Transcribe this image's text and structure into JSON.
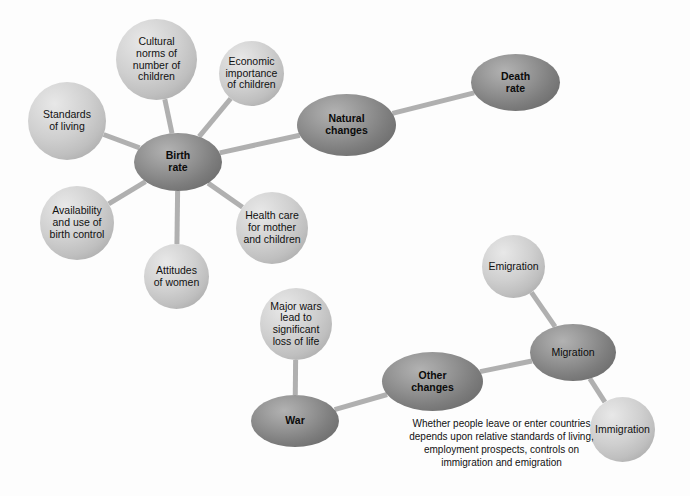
{
  "diagram": {
    "colors": {
      "background": "#fdfdfd",
      "light_node": "#cfcfcf",
      "dark_node": "#8f8f8f",
      "edge": "#b0b0b0",
      "text": "#111111"
    },
    "nodes": [
      {
        "id": "cultural-norms",
        "label": "Cultural\nnorms of\nnumber of\nchildren",
        "style": "light",
        "shape": "circle",
        "x": 116,
        "y": 19,
        "w": 81,
        "h": 81
      },
      {
        "id": "economic-importance",
        "label": "Economic\nimportance\nof children",
        "style": "light",
        "shape": "circle",
        "x": 219,
        "y": 41,
        "w": 65,
        "h": 65
      },
      {
        "id": "standards-of-living",
        "label": "Standards\nof living",
        "style": "light",
        "shape": "circle",
        "x": 28,
        "y": 82,
        "w": 78,
        "h": 78
      },
      {
        "id": "birth-rate",
        "label": "Birth\nrate",
        "style": "dark",
        "shape": "ellipse",
        "x": 134,
        "y": 133,
        "w": 88,
        "h": 58
      },
      {
        "id": "natural-changes",
        "label": "Natural\nchanges",
        "style": "dark",
        "shape": "ellipse",
        "x": 297,
        "y": 94,
        "w": 99,
        "h": 62
      },
      {
        "id": "death-rate",
        "label": "Death\nrate",
        "style": "dark",
        "shape": "ellipse",
        "x": 471,
        "y": 54,
        "w": 89,
        "h": 57
      },
      {
        "id": "availability-birth-control",
        "label": "Availability\nand use of\nbirth control",
        "style": "light",
        "shape": "circle",
        "x": 40,
        "y": 186,
        "w": 74,
        "h": 74
      },
      {
        "id": "attitudes-of-women",
        "label": "Attitudes\nof women",
        "style": "light",
        "shape": "circle",
        "x": 144,
        "y": 244,
        "w": 65,
        "h": 65
      },
      {
        "id": "health-care",
        "label": "Health care\nfor mother\nand children",
        "style": "light",
        "shape": "circle",
        "x": 236,
        "y": 192,
        "w": 72,
        "h": 72
      },
      {
        "id": "major-wars",
        "label": "Major wars\nlead to\nsignificant\nloss of life",
        "style": "light",
        "shape": "circle",
        "x": 260,
        "y": 288,
        "w": 72,
        "h": 72
      },
      {
        "id": "war",
        "label": "War",
        "style": "dark",
        "shape": "ellipse",
        "x": 251,
        "y": 395,
        "w": 88,
        "h": 52
      },
      {
        "id": "other-changes",
        "label": "Other\nchanges",
        "style": "dark",
        "shape": "ellipse",
        "x": 382,
        "y": 352,
        "w": 101,
        "h": 59
      },
      {
        "id": "emigration",
        "label": "Emigration",
        "style": "light",
        "shape": "circle",
        "x": 482,
        "y": 235,
        "w": 63,
        "h": 63
      },
      {
        "id": "migration",
        "label": "Migration",
        "style": "dark",
        "shape": "ellipse",
        "x": 530,
        "y": 324,
        "w": 86,
        "h": 57,
        "bold": false
      },
      {
        "id": "immigration",
        "label": "Immigration",
        "style": "light",
        "shape": "circle",
        "x": 590,
        "y": 397,
        "w": 65,
        "h": 65
      }
    ],
    "edges": [
      {
        "id": "edge-cultural-birth",
        "from": "cultural-norms",
        "to": "birth-rate"
      },
      {
        "id": "edge-economic-birth",
        "from": "economic-importance",
        "to": "birth-rate"
      },
      {
        "id": "edge-standards-birth",
        "from": "standards-of-living",
        "to": "birth-rate"
      },
      {
        "id": "edge-availability-birth",
        "from": "availability-birth-control",
        "to": "birth-rate"
      },
      {
        "id": "edge-attitudes-birth",
        "from": "attitudes-of-women",
        "to": "birth-rate"
      },
      {
        "id": "edge-health-birth",
        "from": "health-care",
        "to": "birth-rate"
      },
      {
        "id": "edge-birth-natural",
        "from": "birth-rate",
        "to": "natural-changes"
      },
      {
        "id": "edge-natural-death",
        "from": "natural-changes",
        "to": "death-rate"
      },
      {
        "id": "edge-majorwars-war",
        "from": "major-wars",
        "to": "war"
      },
      {
        "id": "edge-war-other",
        "from": "war",
        "to": "other-changes"
      },
      {
        "id": "edge-other-migration",
        "from": "other-changes",
        "to": "migration"
      },
      {
        "id": "edge-emigration-migration",
        "from": "emigration",
        "to": "migration"
      },
      {
        "id": "edge-migration-immigration",
        "from": "migration",
        "to": "immigration"
      }
    ],
    "caption": {
      "id": "migration-caption",
      "text": "Whether people leave or enter countries\ndepends upon relative standards of living,\nemployment prospects, controls on\nimmigration and emigration",
      "x": 377,
      "y": 417,
      "w": 249
    }
  }
}
